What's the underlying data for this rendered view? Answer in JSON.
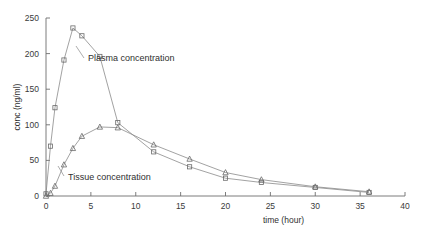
{
  "chart_data": {
    "type": "line",
    "title": "",
    "xlabel": "time (hour)",
    "ylabel": "conc (ng/ml)",
    "xlim": [
      0,
      40
    ],
    "ylim": [
      0,
      250
    ],
    "xticks": [
      0,
      5,
      10,
      15,
      20,
      25,
      30,
      35,
      40
    ],
    "xtick_labels": [
      "0",
      "5",
      "10",
      "15",
      "20",
      "25",
      "30",
      "35",
      "40"
    ],
    "yticks": [
      0,
      50,
      100,
      150,
      200,
      250
    ],
    "ytick_labels": [
      "0",
      "50",
      "100",
      "150",
      "200",
      "250"
    ],
    "grid": false,
    "legend_position": "inline-annotation",
    "series": [
      {
        "name": "Plasma concentration",
        "marker": "square",
        "annotation": "Plasma concentration",
        "x": [
          0,
          0.5,
          1,
          2,
          3,
          4,
          6,
          8,
          12,
          16,
          20,
          24,
          30,
          36
        ],
        "y": [
          3,
          70,
          124,
          191,
          236,
          225,
          196,
          103,
          62,
          41,
          25,
          19,
          12,
          5
        ]
      },
      {
        "name": "Tissue concentration",
        "marker": "triangle",
        "annotation": "Tissue concentration",
        "x": [
          0,
          0.5,
          1,
          2,
          3,
          4,
          6,
          8,
          12,
          16,
          20,
          24,
          30,
          36
        ],
        "y": [
          0,
          4,
          14,
          44,
          67,
          84,
          97,
          96,
          72,
          52,
          33,
          23,
          13,
          6
        ]
      }
    ],
    "annotations": [
      {
        "text": "Plasma concentration",
        "x": 9.5,
        "y": 196
      },
      {
        "text": "Tissue concentration",
        "x": 7.0,
        "y": 38
      }
    ],
    "colors": {
      "axis": "#6e6e6e",
      "plasma_line": "#8a8a8a",
      "tissue_line": "#8a8a8a",
      "marker_stroke": "#6a6a6a",
      "text": "#2f2f2f",
      "background": "#ffffff"
    }
  }
}
